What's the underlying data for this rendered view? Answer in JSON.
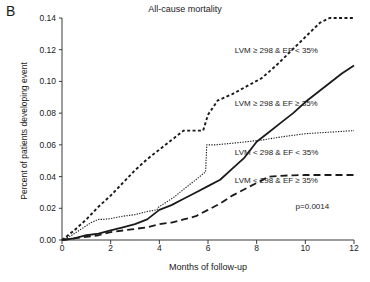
{
  "panel": {
    "letter": "B"
  },
  "chart_data": {
    "type": "line",
    "title": "All-cause mortality",
    "xlabel": "Months of follow-up",
    "ylabel": "Percent of patients developing event",
    "xlim": [
      0,
      12
    ],
    "ylim": [
      0,
      0.14
    ],
    "xticks": [
      "0",
      "2",
      "4",
      "6",
      "8",
      "10",
      "12"
    ],
    "xtick_values": [
      0,
      2,
      4,
      6,
      8,
      10,
      12
    ],
    "yticks": [
      "0.00",
      "0.02",
      "0.04",
      "0.06",
      "0.08",
      "0.10",
      "0.12",
      "0.14"
    ],
    "ytick_values": [
      0.0,
      0.02,
      0.04,
      0.06,
      0.08,
      0.1,
      0.12,
      0.14
    ],
    "grid": false,
    "legend_position": "inline-annotations",
    "annotations": [
      {
        "text": "p=0.0014",
        "x": 9.6,
        "y": 0.021
      }
    ],
    "series": [
      {
        "name": "LVM ≥ 298 & EF < 35%",
        "style": "dotted",
        "label_x": 7.1,
        "label_y": 0.119,
        "x": [
          0,
          0.5,
          1.0,
          1.5,
          2.0,
          2.5,
          3.0,
          3.5,
          4.0,
          4.5,
          5.0,
          5.4,
          5.8,
          6.0,
          6.4,
          7.0,
          7.6,
          8.2,
          8.8,
          9.4,
          10.0,
          10.6,
          11.0,
          12.0
        ],
        "y": [
          0.0,
          0.006,
          0.013,
          0.021,
          0.028,
          0.036,
          0.044,
          0.051,
          0.057,
          0.063,
          0.069,
          0.069,
          0.069,
          0.079,
          0.088,
          0.092,
          0.097,
          0.102,
          0.11,
          0.119,
          0.128,
          0.137,
          0.14,
          0.14
        ]
      },
      {
        "name": "LVM ≥ 298 & EF ≥ 35%",
        "style": "solid",
        "label_x": 7.1,
        "label_y": 0.086,
        "x": [
          0,
          0.5,
          1.0,
          1.5,
          2.0,
          2.5,
          3.0,
          3.5,
          4.0,
          4.5,
          5.0,
          5.5,
          6.0,
          6.5,
          7.0,
          7.5,
          8.0,
          8.5,
          9.0,
          9.5,
          10.0,
          10.5,
          11.0,
          11.5,
          12.0
        ],
        "y": [
          0.0,
          0.001,
          0.003,
          0.004,
          0.006,
          0.008,
          0.01,
          0.013,
          0.019,
          0.022,
          0.026,
          0.03,
          0.034,
          0.038,
          0.045,
          0.052,
          0.062,
          0.068,
          0.074,
          0.08,
          0.087,
          0.093,
          0.099,
          0.105,
          0.11
        ]
      },
      {
        "name": "LVM < 298 & EF < 35%",
        "style": "fine-dotted",
        "label_x": 7.1,
        "label_y": 0.055,
        "x": [
          0,
          0.4,
          0.8,
          1.2,
          1.5,
          1.7,
          2.0,
          2.5,
          3.0,
          3.5,
          3.9,
          3.95,
          4.2,
          4.6,
          5.0,
          5.5,
          5.9,
          5.95,
          6.3,
          7.0,
          7.6,
          8.2,
          9.0,
          10.0,
          11.0,
          12.0
        ],
        "y": [
          0.0,
          0.003,
          0.007,
          0.011,
          0.013,
          0.013,
          0.0135,
          0.015,
          0.016,
          0.018,
          0.019,
          0.0205,
          0.023,
          0.027,
          0.032,
          0.038,
          0.043,
          0.06,
          0.06,
          0.061,
          0.062,
          0.063,
          0.065,
          0.067,
          0.068,
          0.069
        ]
      },
      {
        "name": "LVM < 298 & EF ≥ 35%",
        "style": "dashed",
        "label_x": 7.1,
        "label_y": 0.0375,
        "x": [
          0,
          0.5,
          1.0,
          1.5,
          2.0,
          2.5,
          3.0,
          3.5,
          4.0,
          4.5,
          5.0,
          5.5,
          6.0,
          6.5,
          7.0,
          7.5,
          8.0,
          8.5,
          9.0,
          9.5,
          10.0,
          11.0,
          12.0
        ],
        "y": [
          0.0,
          0.001,
          0.002,
          0.003,
          0.005,
          0.006,
          0.007,
          0.008,
          0.01,
          0.011,
          0.013,
          0.015,
          0.019,
          0.023,
          0.028,
          0.032,
          0.036,
          0.04,
          0.0405,
          0.0408,
          0.041,
          0.041,
          0.041
        ]
      }
    ]
  }
}
